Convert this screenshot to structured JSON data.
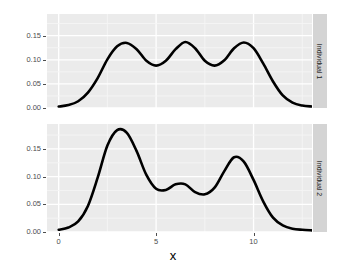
{
  "chart_data": {
    "type": "line",
    "title": "",
    "subtitle": "",
    "xlabel": "x",
    "ylabel": "",
    "grid": true,
    "legend_position": "none",
    "xlim": [
      -0.6,
      13.0
    ],
    "ylim": [
      0.0,
      0.195
    ],
    "xticks": [
      0,
      5,
      10
    ],
    "xtick_labels": [
      "0",
      "5",
      "10"
    ],
    "yticks": [
      0.0,
      0.05,
      0.1,
      0.15
    ],
    "ytick_labels": [
      "0.00",
      "0.05",
      "0.10",
      "0.15"
    ],
    "facet_labels": [
      "Individual 1",
      "Individual 2"
    ],
    "line_color": "#000000",
    "panel_background": "#ebebeb",
    "gridline_color": "#ffffff",
    "strip_background": "#d4d4d4",
    "series": [
      {
        "name": "Individual 1",
        "facet": "Individual 1",
        "x": [
          0.0,
          0.5,
          1.0,
          1.5,
          2.0,
          2.5,
          3.0,
          3.5,
          4.0,
          4.5,
          5.0,
          5.5,
          6.0,
          6.5,
          7.0,
          7.5,
          8.0,
          8.5,
          9.0,
          9.5,
          10.0,
          10.5,
          11.0,
          11.5,
          12.0,
          12.5,
          13.0
        ],
        "values": [
          0.003,
          0.006,
          0.014,
          0.032,
          0.062,
          0.101,
          0.128,
          0.135,
          0.122,
          0.098,
          0.088,
          0.098,
          0.122,
          0.137,
          0.124,
          0.098,
          0.088,
          0.099,
          0.124,
          0.136,
          0.124,
          0.092,
          0.055,
          0.026,
          0.011,
          0.005,
          0.003
        ]
      },
      {
        "name": "Individual 2",
        "facet": "Individual 2",
        "x": [
          0.0,
          0.5,
          1.0,
          1.5,
          2.0,
          2.5,
          3.0,
          3.5,
          4.0,
          4.5,
          5.0,
          5.5,
          6.0,
          6.5,
          7.0,
          7.5,
          8.0,
          8.5,
          9.0,
          9.5,
          10.0,
          10.5,
          11.0,
          11.5,
          12.0,
          12.5,
          13.0
        ],
        "values": [
          0.004,
          0.008,
          0.019,
          0.047,
          0.098,
          0.156,
          0.184,
          0.179,
          0.146,
          0.103,
          0.078,
          0.076,
          0.086,
          0.086,
          0.072,
          0.068,
          0.08,
          0.11,
          0.135,
          0.127,
          0.094,
          0.055,
          0.026,
          0.012,
          0.006,
          0.004,
          0.003
        ]
      }
    ],
    "peaks": {
      "individual_1": [
        {
          "x": 3.3,
          "y": 0.136
        },
        {
          "x": 6.3,
          "y": 0.137
        },
        {
          "x": 9.3,
          "y": 0.136
        }
      ],
      "individual_1_troughs": [
        {
          "x": 4.8,
          "y": 0.088
        },
        {
          "x": 7.8,
          "y": 0.088
        }
      ],
      "individual_2": [
        {
          "x": 3.0,
          "y": 0.185
        },
        {
          "x": 6.2,
          "y": 0.087
        },
        {
          "x": 9.1,
          "y": 0.136
        }
      ],
      "individual_2_troughs": [
        {
          "x": 5.3,
          "y": 0.075
        },
        {
          "x": 7.4,
          "y": 0.068
        }
      ]
    }
  },
  "axis": {
    "x_title": "x",
    "x_tick_labels": [
      "0",
      "5",
      "10"
    ],
    "y_tick_labels": [
      "0.00",
      "0.05",
      "0.10",
      "0.15"
    ]
  },
  "facets": {
    "strip_1": "Individual 1",
    "strip_2": "Individual 2"
  }
}
